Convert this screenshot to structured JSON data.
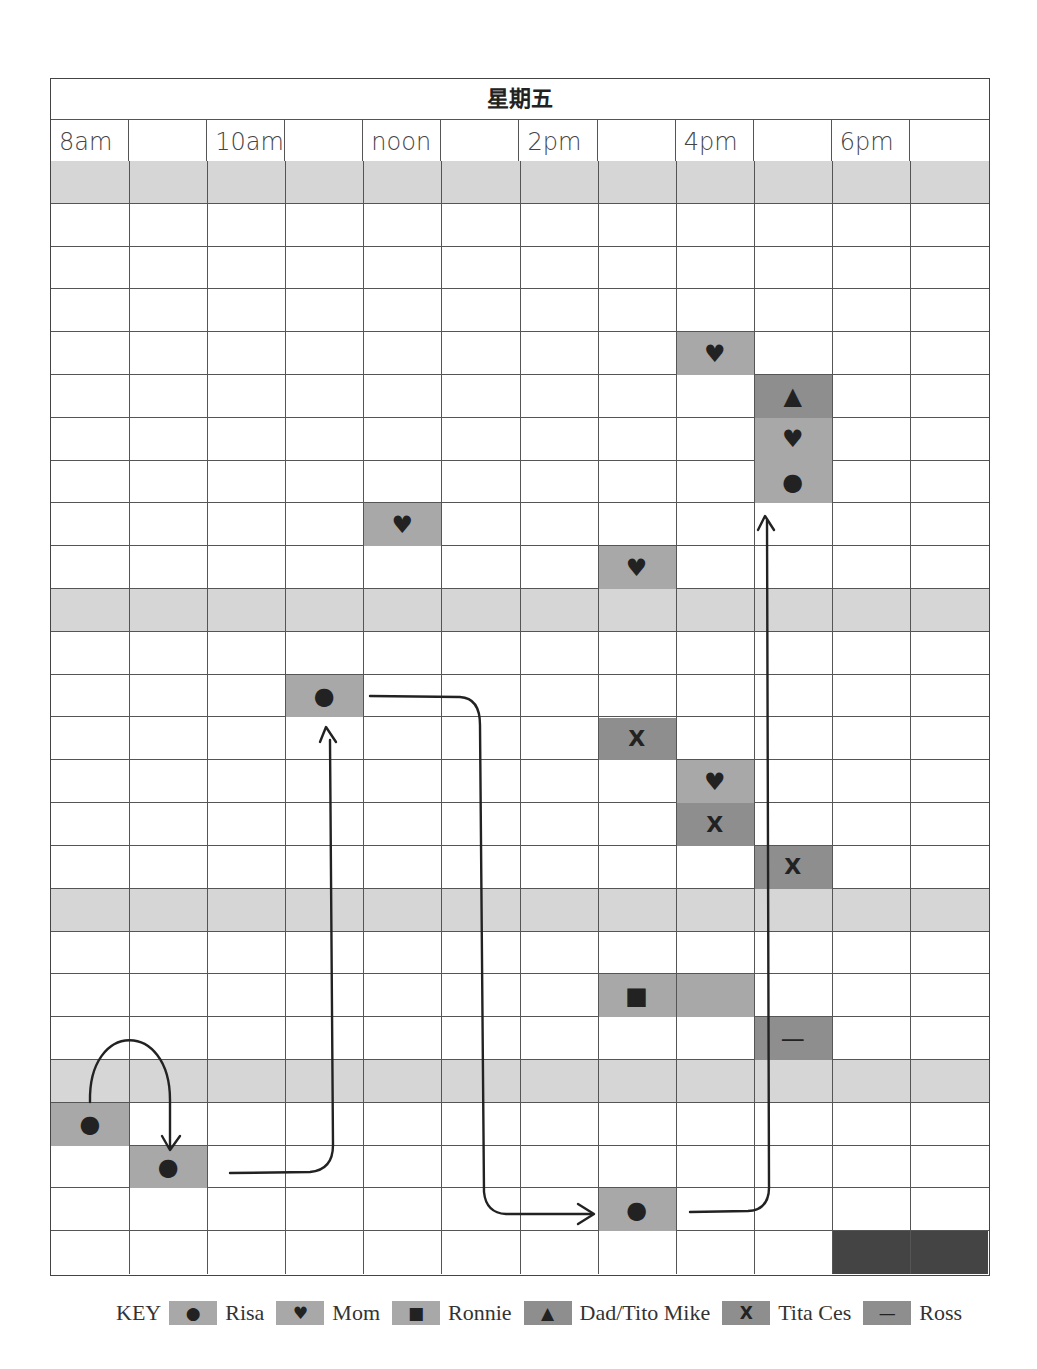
{
  "title": "星期五",
  "columns": 12,
  "time_labels": [
    "8am",
    "",
    "10am",
    "",
    "noon",
    "",
    "2pm",
    "",
    "4pm",
    "",
    "6pm",
    ""
  ],
  "rows": 26,
  "band_rows": [
    0,
    10,
    17,
    21
  ],
  "colors": {
    "band": "#d6d6d6",
    "light_cell": "#a8a8a8",
    "mid_cell": "#8e8e8e",
    "dark_cell": "#444444",
    "symbol": "#222222",
    "grid_line": "#555555"
  },
  "legend": {
    "label": "KEY",
    "items": [
      {
        "symbol": "●",
        "icon": "circle-icon",
        "name": "Risa",
        "color": "#a8a8a8"
      },
      {
        "symbol": "♥",
        "icon": "heart-icon",
        "name": "Mom",
        "color": "#a8a8a8"
      },
      {
        "symbol": "■",
        "icon": "square-icon",
        "name": "Ronnie",
        "color": "#a8a8a8"
      },
      {
        "symbol": "▲",
        "icon": "triangle-icon",
        "name": "Dad/Tito Mike",
        "color": "#8e8e8e"
      },
      {
        "symbol": "X",
        "icon": "x-icon",
        "name": "Tita Ces",
        "color": "#8e8e8e"
      },
      {
        "symbol": "—",
        "icon": "dash-icon",
        "name": "Ross",
        "color": "#8e8e8e"
      }
    ]
  },
  "cells": [
    {
      "row": 4,
      "col": 8,
      "span": 1,
      "symbol": "♥",
      "who": "Mom",
      "color": "#a8a8a8"
    },
    {
      "row": 5,
      "col": 9,
      "span": 1,
      "symbol": "▲",
      "who": "Dad/Tito Mike",
      "color": "#8e8e8e"
    },
    {
      "row": 6,
      "col": 9,
      "span": 1,
      "symbol": "♥",
      "who": "Mom",
      "color": "#a8a8a8"
    },
    {
      "row": 7,
      "col": 9,
      "span": 1,
      "symbol": "●",
      "who": "Risa",
      "color": "#a8a8a8"
    },
    {
      "row": 8,
      "col": 4,
      "span": 1,
      "symbol": "♥",
      "who": "Mom",
      "color": "#a8a8a8"
    },
    {
      "row": 9,
      "col": 7,
      "span": 1,
      "symbol": "♥",
      "who": "Mom",
      "color": "#a8a8a8"
    },
    {
      "row": 12,
      "col": 3,
      "span": 1,
      "symbol": "●",
      "who": "Risa",
      "color": "#a8a8a8"
    },
    {
      "row": 13,
      "col": 7,
      "span": 1,
      "symbol": "X",
      "who": "Tita Ces",
      "color": "#8e8e8e"
    },
    {
      "row": 14,
      "col": 8,
      "span": 1,
      "symbol": "♥",
      "who": "Mom",
      "color": "#a8a8a8"
    },
    {
      "row": 15,
      "col": 8,
      "span": 1,
      "symbol": "X",
      "who": "Tita Ces",
      "color": "#8e8e8e"
    },
    {
      "row": 16,
      "col": 9,
      "span": 1,
      "symbol": "X",
      "who": "Tita Ces",
      "color": "#8e8e8e"
    },
    {
      "row": 19,
      "col": 7,
      "span": 2,
      "symbol": "■",
      "who": "Ronnie",
      "color": "#a8a8a8"
    },
    {
      "row": 20,
      "col": 9,
      "span": 1,
      "symbol": "—",
      "who": "Ross",
      "color": "#8e8e8e"
    },
    {
      "row": 22,
      "col": 0,
      "span": 1,
      "symbol": "●",
      "who": "Risa",
      "color": "#a8a8a8"
    },
    {
      "row": 23,
      "col": 1,
      "span": 1,
      "symbol": "●",
      "who": "Risa",
      "color": "#a8a8a8"
    },
    {
      "row": 24,
      "col": 7,
      "span": 1,
      "symbol": "●",
      "who": "Risa",
      "color": "#a8a8a8"
    },
    {
      "row": 25,
      "col": 10,
      "span": 2,
      "symbol": "",
      "who": "",
      "color": "#444444"
    }
  ],
  "arrows": [
    {
      "from": "Risa r22 c0",
      "to": "Risa r23 c1",
      "shape": "arc"
    },
    {
      "from": "Risa r23 c1",
      "to": "Risa r12 c3",
      "shape": "right-then-up"
    },
    {
      "from": "Risa r12 c3",
      "to": "Risa r24 c7",
      "shape": "right-then-down-then-right"
    },
    {
      "from": "Risa r24 c7",
      "to": "Risa r7 c9",
      "shape": "right-then-up"
    }
  ]
}
